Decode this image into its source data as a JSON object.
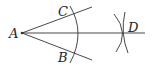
{
  "diagram": {
    "points": {
      "A": {
        "label": "A",
        "x": 22,
        "y": 33
      },
      "B": {
        "label": "B",
        "x": 72,
        "y": 52
      },
      "C": {
        "label": "C",
        "x": 72,
        "y": 15
      },
      "D": {
        "label": "D",
        "x": 125,
        "y": 33
      }
    },
    "colors": {
      "stroke": "#333333",
      "background": "#ffffff"
    }
  }
}
